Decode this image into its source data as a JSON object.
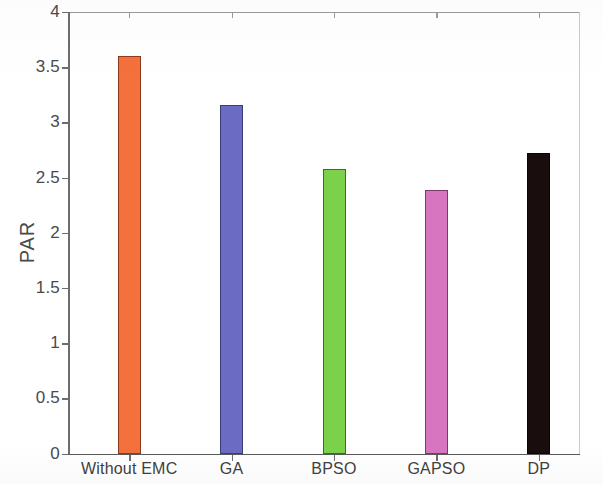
{
  "chart_data": {
    "type": "bar",
    "title": "",
    "xlabel": "",
    "ylabel": "PAR",
    "categories": [
      "Without EMC",
      "GA",
      "BPSO",
      "GAPSO",
      "DP"
    ],
    "values": [
      3.6,
      3.16,
      2.58,
      2.39,
      2.72
    ],
    "colors": [
      "#F4703C",
      "#6B6BC4",
      "#7BD24A",
      "#D875C0",
      "#1A0D0D"
    ],
    "ylim": [
      0,
      4
    ],
    "ytick_labels": [
      "0",
      "0.5",
      "1",
      "1.5",
      "2",
      "2.5",
      "3",
      "3.5",
      "4"
    ],
    "ytick_values": [
      0,
      0.5,
      1,
      1.5,
      2,
      2.5,
      3,
      3.5,
      4
    ],
    "grid": false,
    "legend": "none"
  },
  "axis": {
    "y_label": "PAR"
  },
  "bars": [
    {
      "label": "Without EMC",
      "value": 3.6,
      "color": "#F4703C",
      "edge": "#8C3A1E"
    },
    {
      "label": "GA",
      "value": 3.16,
      "color": "#6B6BC4",
      "edge": "#3A3A77"
    },
    {
      "label": "BPSO",
      "value": 2.58,
      "color": "#7BD24A",
      "edge": "#3C6B24"
    },
    {
      "label": "GAPSO",
      "value": 2.39,
      "color": "#D875C0",
      "edge": "#7A3A68"
    },
    {
      "label": "DP",
      "value": 2.72,
      "color": "#1A0D0D",
      "edge": "#0A0505"
    }
  ]
}
